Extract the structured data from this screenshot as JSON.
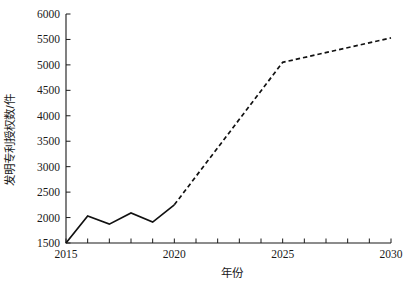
{
  "chart_data": {
    "type": "line",
    "title": "",
    "subtitle": "",
    "xlabel": "年份",
    "ylabel": "发明专利授权数/件",
    "xlim": [
      2015,
      2030
    ],
    "ylim": [
      1500,
      6000
    ],
    "ytick_step": 500,
    "xtick_step": 1,
    "xtick_label_step": 5,
    "grid": false,
    "legend": null,
    "x": [
      2015,
      2016,
      2017,
      2018,
      2019,
      2020,
      2025,
      2030
    ],
    "xticks": [
      2015,
      2016,
      2017,
      2018,
      2019,
      2020,
      2021,
      2022,
      2023,
      2024,
      2025,
      2026,
      2027,
      2028,
      2029,
      2030
    ],
    "xtick_labels": [
      "2015",
      "",
      "",
      "",
      "",
      "2020",
      "",
      "",
      "",
      "",
      "2025",
      "",
      "",
      "",
      "",
      "2030"
    ],
    "yticks": [
      1500,
      2000,
      2500,
      3000,
      3500,
      4000,
      4500,
      5000,
      5500,
      6000
    ],
    "ytick_labels": [
      "1500",
      "2000",
      "2500",
      "3000",
      "3500",
      "4000",
      "4500",
      "5000",
      "5500",
      "6000"
    ],
    "series": [
      {
        "name": "历史值",
        "style": "solid",
        "color": "#111111",
        "x": [
          2015,
          2016,
          2017,
          2018,
          2019,
          2020
        ],
        "values": [
          1500,
          2030,
          1870,
          2090,
          1910,
          2250
        ]
      },
      {
        "name": "预测值",
        "style": "dashed",
        "color": "#111111",
        "x": [
          2020,
          2025,
          2030
        ],
        "values": [
          2250,
          5050,
          5530
        ]
      }
    ],
    "annotations": []
  },
  "axis": {
    "y_title": "发明专利授权数/件",
    "x_title": "年份"
  }
}
